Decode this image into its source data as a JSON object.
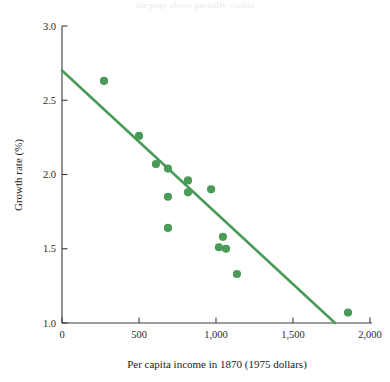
{
  "page": {
    "top_bleed_text": "the page above partially visible"
  },
  "chart_data": {
    "type": "scatter",
    "title": "",
    "xlabel": "Per capita income in 1870 (1975 dollars)",
    "ylabel": "Growth rate (%)",
    "xlim": [
      0,
      2000
    ],
    "ylim": [
      1.0,
      3.0
    ],
    "xticks": [
      0,
      500,
      1000,
      1500,
      2000
    ],
    "xtick_labels": [
      "0",
      "500",
      "1,000",
      "1,500",
      "2,000"
    ],
    "yticks": [
      1.0,
      1.5,
      2.0,
      2.5,
      3.0
    ],
    "ytick_labels": [
      "1.0",
      "1.5",
      "2.0",
      "2.5",
      "3.0"
    ],
    "grid": false,
    "legend": false,
    "marker_color": "#4a9a58",
    "line_color": "#4a9a58",
    "axis_color": "#3a3a3a",
    "points": [
      {
        "x": 273,
        "y": 2.63
      },
      {
        "x": 500,
        "y": 2.26
      },
      {
        "x": 610,
        "y": 2.07
      },
      {
        "x": 688,
        "y": 2.04
      },
      {
        "x": 688,
        "y": 1.85
      },
      {
        "x": 818,
        "y": 1.96
      },
      {
        "x": 818,
        "y": 1.88
      },
      {
        "x": 688,
        "y": 1.64
      },
      {
        "x": 968,
        "y": 1.9
      },
      {
        "x": 1045,
        "y": 1.58
      },
      {
        "x": 1019,
        "y": 1.51
      },
      {
        "x": 1065,
        "y": 1.5
      },
      {
        "x": 1136,
        "y": 1.33
      },
      {
        "x": 1857,
        "y": 1.07
      }
    ],
    "fit_line": {
      "name": "regression line",
      "x0": 0,
      "y0": 2.7,
      "x1": 1773,
      "y1": 1.0
    }
  }
}
